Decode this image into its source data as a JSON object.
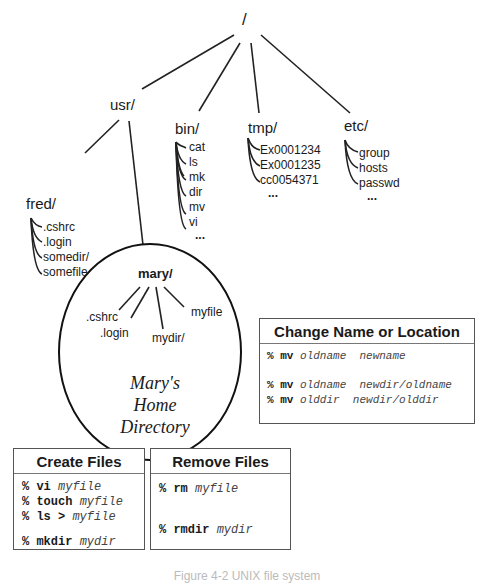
{
  "tree": {
    "root": "/",
    "dirs": [
      {
        "name": "usr/",
        "children": []
      },
      {
        "name": "bin/",
        "children": [
          "cat",
          "ls",
          "mk",
          "dir",
          "mv",
          "vi",
          "..."
        ]
      },
      {
        "name": "tmp/",
        "children": [
          "Ex0001234",
          "Ex0001235",
          "cc0054371",
          "..."
        ]
      },
      {
        "name": "etc/",
        "children": [
          "group",
          "hosts",
          "passwd",
          "..."
        ]
      }
    ],
    "usr_children": [
      {
        "name": "fred/",
        "children": [
          ".cshrc",
          ".login",
          "somedir/",
          "somefile"
        ]
      },
      {
        "name": "mary/",
        "children": [
          ".cshrc",
          ".login",
          "mydir/",
          "myfile"
        ]
      }
    ],
    "mary_home_label": [
      "Mary's",
      "Home",
      "Directory"
    ]
  },
  "boxes": {
    "change": {
      "title": "Change Name or Location",
      "commands": [
        {
          "prompt": "%",
          "cmd": "mv",
          "args": "oldname  newname"
        },
        {
          "gap": true
        },
        {
          "prompt": "%",
          "cmd": "mv",
          "args": "oldname  newdir/oldname"
        },
        {
          "prompt": "%",
          "cmd": "mv",
          "args": "olddir  newdir/olddir"
        }
      ]
    },
    "create": {
      "title": "Create Files",
      "commands": [
        {
          "prompt": "%",
          "cmd": "vi",
          "args": "myfile"
        },
        {
          "prompt": "%",
          "cmd": "touch",
          "args": "myfile"
        },
        {
          "prompt": "%",
          "cmd": "ls >",
          "args": "myfile"
        },
        {
          "gap": true
        },
        {
          "prompt": "%",
          "cmd": "mkdir",
          "args": "mydir"
        }
      ]
    },
    "remove": {
      "title": "Remove Files",
      "commands": [
        {
          "prompt": "%",
          "cmd": "rm",
          "args": "myfile"
        },
        {
          "gap": true
        },
        {
          "gap": true
        },
        {
          "prompt": "%",
          "cmd": "rmdir",
          "args": "mydir"
        }
      ]
    }
  },
  "caption": "Figure 4-2  UNIX file system"
}
